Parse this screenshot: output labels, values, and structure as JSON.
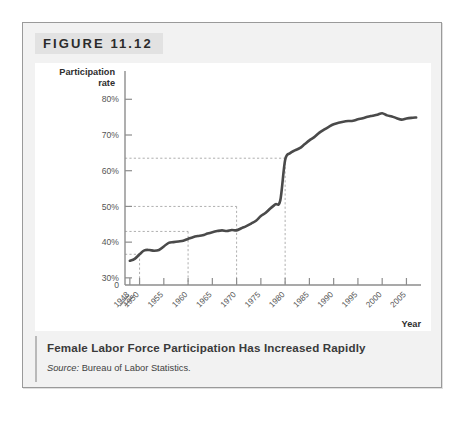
{
  "figure": {
    "label": "FIGURE 11.12",
    "caption": "Female Labor Force Participation Has Increased Rapidly",
    "source_prefix": "Source:",
    "source_text": "Bureau of Labor Statistics."
  },
  "colors": {
    "page_background": "#ffffff",
    "card_background": "#f2f2f2",
    "panel_background": "#ffffff",
    "banner_background": "#e2e2e2",
    "line": "#4a4a4a",
    "axis": "#8d8d8d",
    "guide": "#9a9a9a",
    "text": "#555555"
  },
  "chart_data": {
    "type": "line",
    "title": "Female Labor Force Participation Has Increased Rapidly",
    "xlabel": "Year",
    "ylabel": "Participation rate",
    "ylabel_line1": "Participation",
    "ylabel_line2": "rate",
    "zero_label": "0",
    "ylim": [
      28,
      84
    ],
    "xlim": [
      1947,
      2008
    ],
    "grid": false,
    "legend": "none",
    "axis_break": true,
    "ytick_values": [
      30,
      40,
      50,
      60,
      70,
      80
    ],
    "ytick_labels": [
      "30%",
      "40%",
      "50%",
      "60%",
      "70%",
      "80%"
    ],
    "xtick_values": [
      1948,
      1950,
      1955,
      1960,
      1965,
      1970,
      1975,
      1980,
      1985,
      1990,
      1995,
      2000,
      2005
    ],
    "xtick_labels": [
      "1948",
      "1950",
      "1955",
      "1960",
      "1965",
      "1970",
      "1975",
      "1980",
      "1985",
      "1990",
      "1995",
      "2000",
      "2005"
    ],
    "xtick_rotation": -45,
    "series": [
      {
        "name": "Female labor force participation rate",
        "x": [
          1948,
          1949,
          1950,
          1951,
          1952,
          1953,
          1954,
          1955,
          1956,
          1957,
          1958,
          1959,
          1960,
          1961,
          1962,
          1963,
          1964,
          1965,
          1966,
          1967,
          1968,
          1969,
          1970,
          1971,
          1972,
          1973,
          1974,
          1975,
          1976,
          1977,
          1978,
          1979,
          1980,
          1981,
          1982,
          1983,
          1984,
          1985,
          1986,
          1987,
          1988,
          1989,
          1990,
          1991,
          1992,
          1993,
          1994,
          1995,
          1996,
          1997,
          1998,
          1999,
          2000,
          2001,
          2002,
          2003,
          2004,
          2005,
          2006,
          2007
        ],
        "values": [
          34.8,
          35.3,
          36.6,
          37.7,
          37.8,
          37.6,
          37.8,
          38.8,
          39.8,
          40.0,
          40.2,
          40.4,
          40.9,
          41.4,
          41.7,
          41.9,
          42.4,
          42.8,
          43.1,
          43.3,
          43.1,
          43.4,
          43.3,
          43.9,
          44.5,
          45.2,
          46.0,
          47.3,
          48.2,
          49.5,
          50.6,
          51.7,
          63.0,
          64.9,
          65.7,
          66.3,
          67.4,
          68.5,
          69.4,
          70.6,
          71.5,
          72.3,
          73.0,
          73.4,
          73.7,
          73.9,
          74.0,
          74.4,
          74.7,
          75.1,
          75.4,
          75.7,
          76.1,
          75.5,
          75.2,
          74.7,
          74.3,
          74.6,
          74.8,
          74.9
        ],
        "note": "Series rendered as a smooth S-curve rising from ~35% in 1948 to a ~76% peak near 1999-2000, flattening at ~75% through 2007."
      }
    ],
    "reference_markers": [
      {
        "year": 1950,
        "rate": 36.6,
        "label": "1950 ~37%"
      },
      {
        "year": 1960,
        "rate": 43.0,
        "label": "1960 ~43%"
      },
      {
        "year": 1970,
        "rate": 50.0,
        "label": "1970 ~50%"
      },
      {
        "year": 1980,
        "rate": 63.5,
        "label": "1980 ~63.5%"
      }
    ]
  }
}
